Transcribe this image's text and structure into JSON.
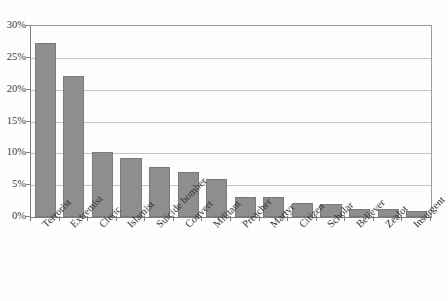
{
  "chart_data": {
    "type": "bar",
    "title": "",
    "subtitle": "",
    "xlabel": "",
    "ylabel": "",
    "categories": [
      "Terrorist",
      "Extremist",
      "Cleric",
      "Islamist",
      "Suicide bomber",
      "Convert",
      "Militant",
      "Preacher",
      "Martyr",
      "Citizen",
      "Scholar",
      "Believer",
      "Zealot",
      "Insurgent"
    ],
    "values": [
      27.3,
      22.1,
      10.2,
      9.2,
      7.9,
      7.1,
      5.9,
      3.2,
      3.2,
      2.2,
      2.1,
      1.3,
      1.2,
      0.9
    ],
    "value_unit": "%",
    "ylim": [
      0,
      30
    ],
    "ytick_values": [
      0,
      5,
      10,
      15,
      20,
      25,
      30
    ],
    "ytick_labels": [
      "0%",
      "5%",
      "10%",
      "15%",
      "20%",
      "25%",
      "30%"
    ],
    "grid": "horizontal",
    "legend": "none",
    "legend_position": "none",
    "series": [
      {
        "name": "Share",
        "values": [
          27.3,
          22.1,
          10.2,
          9.2,
          7.9,
          7.1,
          5.9,
          3.2,
          3.2,
          2.2,
          2.1,
          1.3,
          1.2,
          0.9
        ]
      }
    ],
    "colors": {
      "bar_fill": "#8e8e8e",
      "bar_edge": "#7a7a7a",
      "gridline": "#c4c4c4",
      "axis": "#7d7d7d",
      "plot_border": "#9a9a9a",
      "text": "#333333",
      "background": "#fdfdfd"
    },
    "x_label_rotation": -45
  }
}
